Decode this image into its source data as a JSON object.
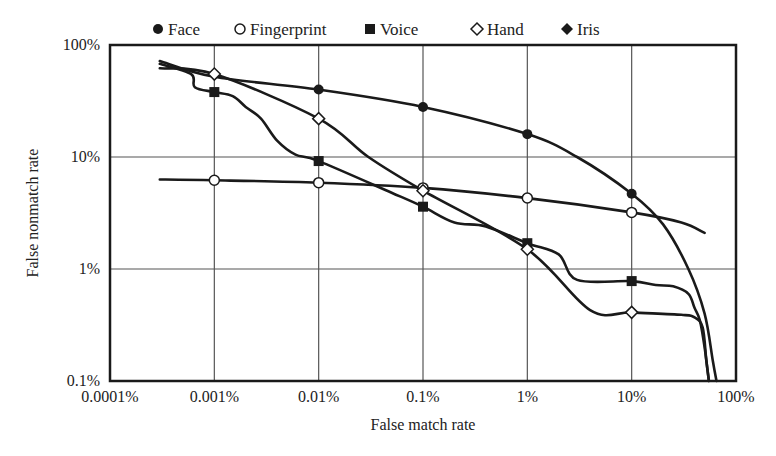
{
  "chart_data": {
    "type": "line",
    "title": "",
    "xlabel": "False match rate",
    "ylabel": "False nonmatch rate",
    "xscale": "log",
    "yscale": "log",
    "xlim": [
      0.0001,
      100
    ],
    "ylim": [
      0.1,
      100
    ],
    "x_unit": "%",
    "y_unit": "%",
    "grid": true,
    "legend_position": "top",
    "x_ticks": [
      "0.0001%",
      "0.001%",
      "0.01%",
      "0.1%",
      "1%",
      "10%",
      "100%"
    ],
    "y_ticks": [
      "0.1%",
      "1%",
      "10%",
      "100%"
    ],
    "legend": [
      {
        "name": "Face",
        "marker": "filled-circle"
      },
      {
        "name": "Fingerprint",
        "marker": "open-circle"
      },
      {
        "name": "Voice",
        "marker": "filled-square"
      },
      {
        "name": "Hand",
        "marker": "open-diamond"
      },
      {
        "name": "Iris",
        "marker": "filled-diamond"
      }
    ],
    "series": [
      {
        "name": "Face",
        "marker": "filled-circle",
        "markers": {
          "x": [
            0.01,
            0.1,
            1,
            10
          ],
          "y": [
            40,
            28,
            16,
            4.7
          ]
        },
        "curve": {
          "x": [
            0.0003,
            0.001,
            0.01,
            0.1,
            1,
            3,
            10,
            20,
            35,
            50,
            60,
            65
          ],
          "y": [
            72,
            52,
            40,
            28,
            16,
            10,
            4.7,
            2.5,
            1.0,
            0.4,
            0.15,
            0.1
          ]
        }
      },
      {
        "name": "Fingerprint",
        "marker": "open-circle",
        "markers": {
          "x": [
            0.001,
            0.01,
            0.1,
            1,
            10
          ],
          "y": [
            6.2,
            5.9,
            5.3,
            4.3,
            3.2
          ]
        },
        "curve": {
          "x": [
            0.0003,
            0.001,
            0.01,
            0.1,
            1,
            10,
            30,
            50
          ],
          "y": [
            6.3,
            6.2,
            5.9,
            5.3,
            4.3,
            3.2,
            2.6,
            2.1
          ]
        }
      },
      {
        "name": "Voice",
        "marker": "filled-square",
        "markers": {
          "x": [
            0.001,
            0.01,
            0.1,
            1,
            10
          ],
          "y": [
            38,
            9.2,
            3.6,
            1.7,
            0.78
          ]
        },
        "curve": {
          "x": [
            0.0003,
            0.0006,
            0.00065,
            0.001,
            0.0015,
            0.002,
            0.0028,
            0.004,
            0.006,
            0.01,
            0.05,
            0.1,
            0.2,
            0.4,
            1,
            2,
            3,
            10,
            17,
            25,
            35,
            40,
            45,
            50,
            55
          ],
          "y": [
            68,
            55,
            42,
            38,
            35,
            28,
            22,
            14,
            10.5,
            9.2,
            4.8,
            3.6,
            2.6,
            2.4,
            1.7,
            1.35,
            0.8,
            0.78,
            0.72,
            0.7,
            0.6,
            0.45,
            0.35,
            0.2,
            0.1
          ]
        }
      },
      {
        "name": "Hand",
        "marker": "open-diamond",
        "markers": {
          "x": [
            0.001,
            0.01,
            0.1,
            1,
            10
          ],
          "y": [
            55,
            22,
            5,
            1.5,
            0.41
          ]
        },
        "curve": {
          "x": [
            0.0003,
            0.001,
            0.01,
            0.03,
            0.1,
            1,
            4,
            10,
            30,
            40,
            48,
            52,
            55
          ],
          "y": [
            62,
            55,
            22,
            10,
            5,
            1.5,
            0.43,
            0.41,
            0.39,
            0.37,
            0.3,
            0.15,
            0.1
          ]
        }
      }
    ]
  }
}
